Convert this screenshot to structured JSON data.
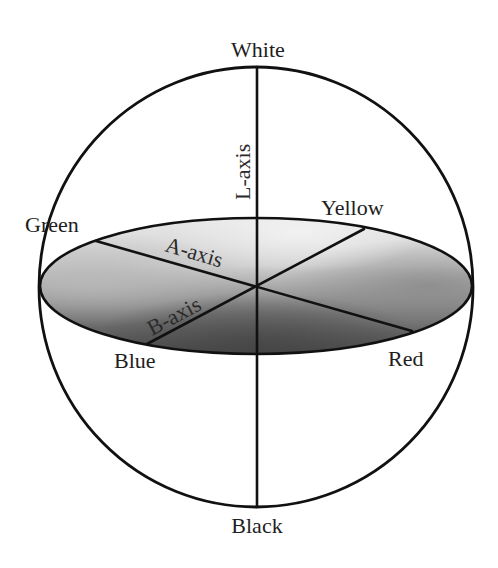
{
  "diagram": {
    "poles": {
      "top": "White",
      "bottom": "Black"
    },
    "color_points": {
      "green": "Green",
      "yellow": "Yellow",
      "blue": "Blue",
      "red": "Red"
    },
    "axes": {
      "l_axis": "L-axis",
      "a_axis": "A-axis",
      "b_axis": "B-axis"
    },
    "colors": {
      "line": "#111111",
      "text": "#1e1e1e",
      "ellipse_top": "#e8e8e8",
      "ellipse_left": "#b4b4b4",
      "ellipse_right": "#8c8c8c",
      "ellipse_bottom": "#505050",
      "background": "#ffffff"
    }
  }
}
